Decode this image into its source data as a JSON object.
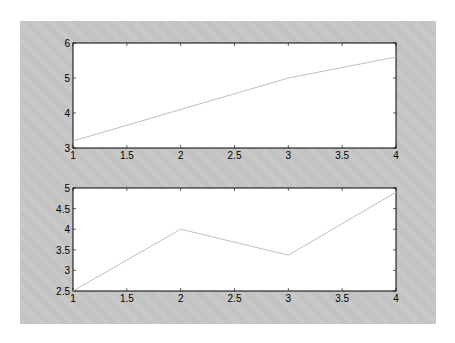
{
  "figure": {
    "background_color": "#c8c8c8",
    "axes_color": "#ffffff",
    "line_color": "#c0c0c0"
  },
  "chart_data": [
    {
      "type": "line",
      "title": "",
      "xlabel": "",
      "ylabel": "",
      "x": [
        1,
        2,
        3,
        4
      ],
      "series": [
        {
          "name": "series1",
          "values": [
            3.2,
            4.1,
            5.0,
            5.6
          ]
        }
      ],
      "xlim": [
        1,
        4
      ],
      "ylim": [
        3,
        6
      ],
      "xticks": [
        "1",
        "1.5",
        "2",
        "2.5",
        "3",
        "3.5",
        "4"
      ],
      "yticks": [
        "3",
        "4",
        "5",
        "6"
      ],
      "grid": false,
      "legend": null
    },
    {
      "type": "line",
      "title": "",
      "xlabel": "",
      "ylabel": "",
      "x": [
        1,
        2,
        3,
        4
      ],
      "series": [
        {
          "name": "series1",
          "values": [
            2.5,
            4.0,
            3.37,
            4.9
          ]
        }
      ],
      "xlim": [
        1,
        4
      ],
      "ylim": [
        2.5,
        5
      ],
      "xticks": [
        "1",
        "1.5",
        "2",
        "2.5",
        "3",
        "3.5",
        "4"
      ],
      "yticks": [
        "2.5",
        "3",
        "3.5",
        "4",
        "4.5",
        "5"
      ],
      "grid": false,
      "legend": null
    }
  ]
}
